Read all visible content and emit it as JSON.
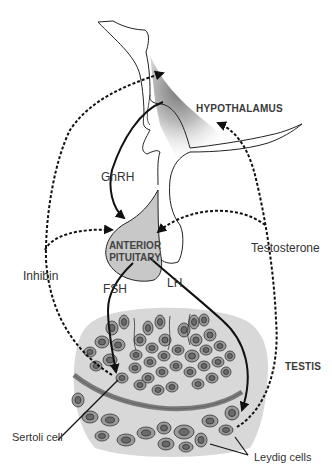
{
  "labels": {
    "hypothalamus": "HYPOTHALAMUS",
    "anterior_pituitary_line1": "ANTERIOR",
    "anterior_pituitary_line2": "PITUITARY",
    "testis": "TESTIS",
    "gnrh": "GnRH",
    "fsh": "FSH",
    "lh": "LH",
    "inhibin": "Inhibin",
    "testosterone": "Testosterone",
    "sertoli_cell": "Sertoli cell",
    "leydig_cells": "Leydig cells"
  },
  "pathways": [
    {
      "from": "hypothalamus",
      "to": "anterior pituitary",
      "hormone": "GnRH",
      "style": "solid",
      "effect": "stimulatory"
    },
    {
      "from": "anterior pituitary",
      "to": "Sertoli cell",
      "hormone": "FSH",
      "style": "solid",
      "effect": "stimulatory"
    },
    {
      "from": "anterior pituitary",
      "to": "Leydig cells",
      "hormone": "LH",
      "style": "solid",
      "effect": "stimulatory"
    },
    {
      "from": "testis",
      "to": "anterior pituitary",
      "hormone": "Inhibin",
      "style": "dashed",
      "effect": "negative feedback"
    },
    {
      "from": "testis",
      "to": "hypothalamus",
      "hormone": "Inhibin",
      "style": "dashed",
      "effect": "negative feedback"
    },
    {
      "from": "Leydig cells",
      "to": "anterior pituitary",
      "hormone": "Testosterone",
      "style": "dashed",
      "effect": "negative feedback"
    },
    {
      "from": "Leydig cells",
      "to": "hypothalamus",
      "hormone": "Testosterone",
      "style": "dashed",
      "effect": "negative feedback"
    }
  ],
  "colors": {
    "line": "#111111",
    "pituitary_fill": "#c8c8c8",
    "testis_fill": "#d8d8d8",
    "cell_fill": "#9a9a9a",
    "nucleus_fill": "#6a6a6a",
    "basement_membrane": "#7a7a7a"
  }
}
